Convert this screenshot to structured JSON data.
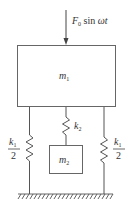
{
  "diagram": {
    "force": {
      "label_main": "F",
      "label_sub": "0",
      "label_rest": " sin ",
      "label_omega": "ωt",
      "direction": "down"
    },
    "masses": [
      {
        "id": "m1",
        "symbol": "m",
        "subscript": "1"
      },
      {
        "id": "m2",
        "symbol": "m",
        "subscript": "2"
      }
    ],
    "springs": [
      {
        "id": "left",
        "num": "k",
        "num_sub": "1",
        "den": "2"
      },
      {
        "id": "middle",
        "symbol": "k",
        "subscript": "2"
      },
      {
        "id": "right",
        "num": "k",
        "num_sub": "1",
        "den": "2"
      }
    ],
    "ground": "fixed support",
    "colors": {
      "line": "#555555",
      "text": "#333333"
    }
  }
}
